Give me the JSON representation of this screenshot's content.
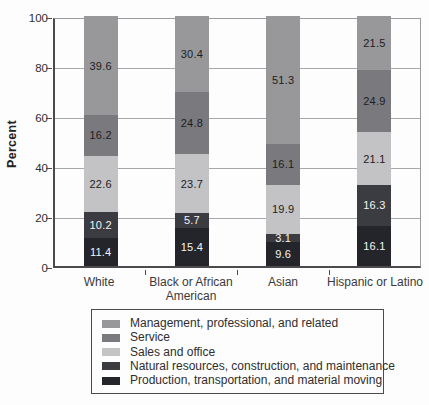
{
  "chart_data": {
    "type": "bar",
    "stacked": true,
    "title": "",
    "xlabel": "",
    "ylabel": "Percent",
    "ylim": [
      0,
      100
    ],
    "yticks": [
      0,
      20,
      40,
      60,
      80,
      100
    ],
    "grid": true,
    "legend_position": "bottom",
    "categories": [
      "White",
      "Black or African American",
      "Asian",
      "Hispanic or Latino"
    ],
    "categories_display": [
      [
        "White"
      ],
      [
        "Black or African",
        "American"
      ],
      [
        "Asian"
      ],
      [
        "Hispanic or Latino"
      ]
    ],
    "series": [
      {
        "name": "Management, professional, and related",
        "values": [
          39.6,
          30.4,
          51.3,
          21.5
        ],
        "color": "#98989b",
        "label_color": "#1c1c1e"
      },
      {
        "name": "Service",
        "values": [
          16.2,
          24.8,
          16.1,
          24.9
        ],
        "color": "#7a7a7e",
        "label_color": "#1c1c1e"
      },
      {
        "name": "Sales and office",
        "values": [
          22.6,
          23.7,
          19.9,
          21.1
        ],
        "color": "#c3c3c5",
        "label_color": "#1c1c1e"
      },
      {
        "name": "Natural resources, construction, and maintenance",
        "values": [
          10.2,
          5.7,
          3.1,
          16.3
        ],
        "color": "#3b3b42",
        "label_color": "#f4f4f4"
      },
      {
        "name": "Production, transportation, and material moving",
        "values": [
          11.4,
          15.4,
          9.6,
          16.1
        ],
        "color": "#24242b",
        "label_color": "#f4f4f4"
      }
    ]
  },
  "colors": {
    "axis": "#4b4b4e",
    "grid": "#a8a8aa",
    "box": "#9b9b9d",
    "text": "#2e2e30"
  }
}
